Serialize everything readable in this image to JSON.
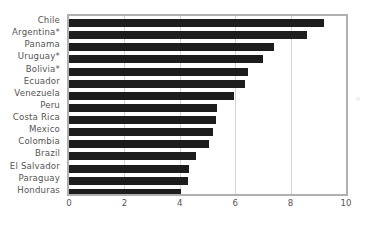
{
  "chart_data": {
    "type": "bar",
    "orientation": "horizontal",
    "title": "",
    "subtitle": "",
    "xlabel": "",
    "ylabel": "",
    "xlim": [
      0,
      10
    ],
    "ylim": null,
    "grid": "vertical",
    "legend": null,
    "xticks": [
      "0",
      "2",
      "4",
      "6",
      "8",
      "10"
    ],
    "xtick_values": [
      0,
      2,
      4,
      6,
      8,
      10
    ],
    "categories": [
      "Chile",
      "Argentina*",
      "Panama",
      "Uruguay*",
      "Bolivia*",
      "Ecuador",
      "Venezuela",
      "Peru",
      "Costa Rica",
      "Mexico",
      "Colombia",
      "Brazil",
      "El Salvador",
      "Paraguay",
      "Honduras"
    ],
    "values": [
      9.2,
      8.6,
      7.4,
      7.0,
      6.45,
      6.35,
      5.95,
      5.35,
      5.3,
      5.2,
      5.05,
      4.6,
      4.35,
      4.3,
      4.05
    ],
    "series": [
      {
        "name": "",
        "color": "#1d1d1d",
        "values": [
          9.2,
          8.6,
          7.4,
          7.0,
          6.45,
          6.35,
          5.95,
          5.35,
          5.3,
          5.2,
          5.05,
          4.6,
          4.35,
          4.3,
          4.05
        ]
      }
    ],
    "annotations": []
  },
  "style": {
    "bar_color": "#1d1d1d",
    "grid_color": "#d4d4d4",
    "frame_color": "#b0b0b0",
    "tick_label_color": "#555555",
    "background": "#ffffff"
  },
  "artifact": {
    "mark": "ıı"
  }
}
